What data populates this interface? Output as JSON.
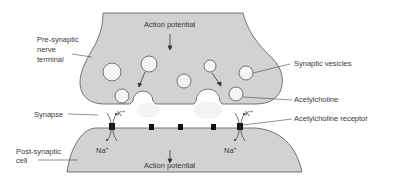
{
  "colors": {
    "membrane_fill": "#d2d2d2",
    "membrane_stroke": "#555555",
    "vesicle_fill": "#f4f4f4",
    "receptor": "#111111",
    "text": "#3a3a3a"
  },
  "labels": {
    "action_potential_top": "Action potential",
    "presynaptic": [
      "Pre-synaptic",
      "nerve",
      "terminal"
    ],
    "synaptic_vesicles": "Synaptic vesicles",
    "acetylcholine": "Acetylcholine",
    "synapse": "Synapse",
    "acetylcholine_receptor": "Acetylcholine receptor",
    "postsynaptic": [
      "Post-synaptic",
      "cell"
    ],
    "potassium": "K",
    "sodium": "Na",
    "ion_charge": "+",
    "action_potential_bottom": "Action potential"
  }
}
